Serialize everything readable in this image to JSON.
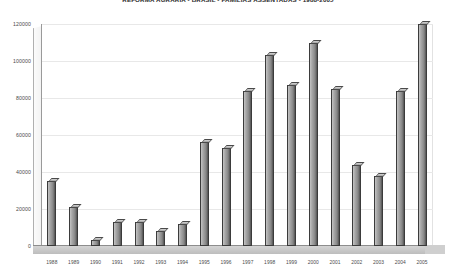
{
  "chart_data": {
    "type": "bar",
    "title": "REFORMA AGRÁRIA - BRASIL - FAMÍLIAS ASSENTADAS - 1988-2005",
    "xlabel": "",
    "ylabel": "",
    "categories": [
      "1988",
      "1989",
      "1990",
      "1991",
      "1992",
      "1993",
      "1994",
      "1995",
      "1996",
      "1997",
      "1998",
      "1999",
      "2000",
      "2001",
      "2002",
      "2003",
      "2004",
      "2005"
    ],
    "values": [
      35000,
      21000,
      3500,
      13000,
      13000,
      8000,
      12000,
      56000,
      53000,
      84000,
      103000,
      87000,
      110000,
      85000,
      44000,
      38000,
      84000,
      120000
    ],
    "ylim": [
      0,
      120000
    ],
    "ytick_labels": [
      "120000",
      "100000",
      "80000",
      "60000",
      "40000",
      "20000",
      "0"
    ],
    "ytick_values": [
      120000,
      100000,
      80000,
      60000,
      40000,
      20000,
      0
    ],
    "grid": true,
    "legend": false,
    "bar_color": "#8f8f8f",
    "bar_edge_color": "#3b3b3b",
    "background_color": "#ffffff",
    "gridline_color": "#e8e8e8",
    "axis_color": "#9a9a9a",
    "floor_color": "#c6c6c6"
  }
}
